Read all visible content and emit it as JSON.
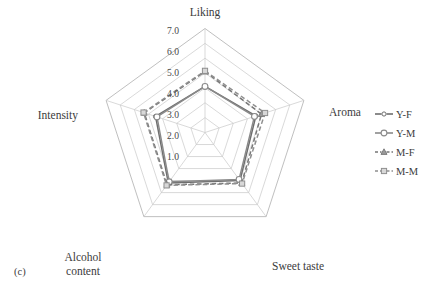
{
  "figure": {
    "panel_caption": "(c)",
    "background": "#ffffff"
  },
  "chart_data": {
    "type": "radar",
    "title": "",
    "subtitle": "",
    "xlabel": "",
    "ylabel": "",
    "categories": [
      "Liking",
      "Aroma",
      "Sweet taste",
      "Alcohol content",
      "Intensity"
    ],
    "radial_ticks": [
      "1.0",
      "2.0",
      "3.0",
      "4.0",
      "5.0",
      "6.0",
      "7.0"
    ],
    "radial_tick_values": [
      1.0,
      2.0,
      3.0,
      4.0,
      5.0,
      6.0,
      7.0
    ],
    "rlim": [
      0,
      7
    ],
    "grid": true,
    "legend_position": "right",
    "series": [
      {
        "name": "Y-F",
        "values": [
          3.1,
          3.6,
          4.0,
          4.2,
          3.5
        ],
        "line_style": "solid",
        "marker": "circle-open-small",
        "color": "#6e6e6e"
      },
      {
        "name": "Y-M",
        "values": [
          3.1,
          3.5,
          3.9,
          4.1,
          3.4
        ],
        "line_style": "solid",
        "marker": "circle-open-large",
        "color": "#8a8a8a"
      },
      {
        "name": "M-F",
        "values": [
          4.1,
          4.0,
          4.2,
          4.35,
          4.3
        ],
        "line_style": "dashed",
        "marker": "triangle",
        "color": "#767676"
      },
      {
        "name": "M-M",
        "values": [
          4.15,
          4.25,
          4.25,
          4.4,
          4.35
        ],
        "line_style": "dashed",
        "marker": "square",
        "color": "#8f8f8f"
      }
    ]
  },
  "axis_labels": {
    "liking": "Liking",
    "aroma": "Aroma",
    "sweet_taste": "Sweet taste",
    "alcohol_content_line1": "Alcohol",
    "alcohol_content_line2": "content",
    "intensity": "Intensity"
  },
  "ticks": {
    "t7": "7.0",
    "t6": "6.0",
    "t5": "5.0",
    "t4": "4.0",
    "t3": "3.0",
    "t2": "2.0",
    "t1": "1.0"
  },
  "legend": {
    "items": [
      {
        "label": "Y-F",
        "marker": "circle-open-small",
        "dash": "solid"
      },
      {
        "label": "Y-M",
        "marker": "circle-open-large",
        "dash": "solid"
      },
      {
        "label": "M-F",
        "marker": "triangle",
        "dash": "dashed"
      },
      {
        "label": "M-M",
        "marker": "square",
        "dash": "dashed"
      }
    ]
  },
  "colors": {
    "grid": "#c9c9c9",
    "outer": "#b8b8b8",
    "text": "#3c3c3c",
    "series_yf": "#6e6e6e",
    "series_ym": "#8a8a8a",
    "series_mf": "#767676",
    "series_mm": "#8f8f8f"
  }
}
